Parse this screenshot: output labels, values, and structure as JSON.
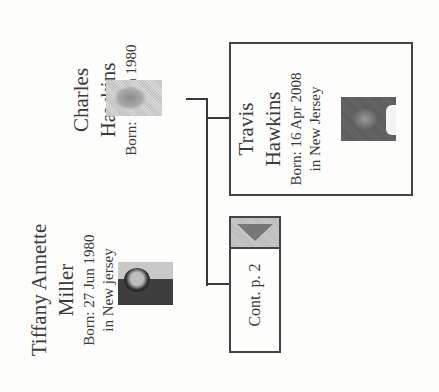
{
  "persons": [
    {
      "id": "charles",
      "name_line1": "Charles",
      "name_line2": "Hawkins",
      "born": "Born: 13 Jun 1980",
      "place": ""
    },
    {
      "id": "tiffany",
      "name_line1": "Tiffany Annette",
      "name_line2": "Miller",
      "born": "Born: 27 Jun 1980",
      "place": "in New jersey"
    },
    {
      "id": "travis",
      "name_line1": "Travis",
      "name_line2": "Hawkins",
      "born": "Born: 16 Apr 2008",
      "place": "in New Jersey"
    }
  ],
  "continuation": {
    "label": "Cont. p. 2",
    "icon": "triangle-down-icon"
  },
  "colors": {
    "line": "#3a3a3a",
    "box_border": "#444444",
    "cont_header": "#c9c9c9",
    "cont_arrow": "#777777"
  }
}
